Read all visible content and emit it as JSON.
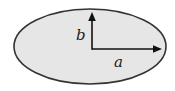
{
  "diagram": {
    "title": "",
    "shape": "ellipse",
    "colors": {
      "fill": "#e6e6e6",
      "stroke": "#333333",
      "arrow": "#111111",
      "label": "#222222",
      "background": "#ffffff"
    },
    "ellipse": {
      "cx": 90,
      "cy": 46.5,
      "rx": 76,
      "ry": 37.5
    },
    "arrows": [
      {
        "id": "semi-major",
        "from": [
          92,
          49
        ],
        "to": [
          162,
          49
        ],
        "label": "a"
      },
      {
        "id": "semi-minor",
        "from": [
          92,
          49
        ],
        "to": [
          92,
          12
        ],
        "label": "b"
      }
    ],
    "labels": {
      "a": "a",
      "b": "b"
    }
  }
}
